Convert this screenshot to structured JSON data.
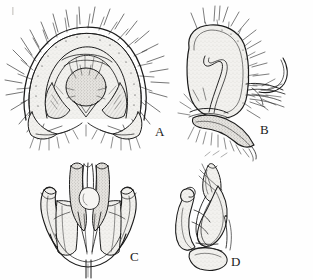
{
  "figure": {
    "type": "scientific-illustration-plate",
    "medium": "pen-and-ink line drawing",
    "background_color": "#fefefe",
    "ink_color": "#1a1a1a",
    "fill_tone": "#ebeae6",
    "panel_count": 4
  },
  "labels": {
    "a": "A",
    "b": "B",
    "c": "C",
    "d": "D"
  },
  "panels": [
    {
      "id": "A",
      "label": "A",
      "view": "ventral / posterior view",
      "description": "broad dome-shaped epandrium with dense radiating setae along the margin, paired inner arches, a central stippled ovoid lobe and paired basal surstyli",
      "label_position": {
        "x": 155,
        "y": 125
      },
      "bounds": {
        "x": 8,
        "y": 8,
        "w": 160,
        "h": 140
      }
    },
    {
      "id": "B",
      "label": "B",
      "view": "lateral view",
      "description": "rounded quadrate epandrial lobe stippled throughout, setae dense along posterior margin, curved apical hook and a ventral pointed projection bearing setae",
      "label_position": {
        "x": 260,
        "y": 123
      },
      "bounds": {
        "x": 175,
        "y": 5,
        "w": 135,
        "h": 150
      }
    },
    {
      "id": "C",
      "label": "C",
      "view": "ventral view of aedeagal complex",
      "description": "symmetric structure with paired outward-curving hook-like lateral gonostyli, a central column of parallel rods and a slender basal stem",
      "label_position": {
        "x": 130,
        "y": 250
      },
      "bounds": {
        "x": 28,
        "y": 158,
        "w": 120,
        "h": 118
      }
    },
    {
      "id": "D",
      "label": "D",
      "view": "lateral view of aedeagal complex",
      "description": "elongate curved overlapping lobes with an apical knob, a slender distal process and a rounded basal plate",
      "label_position": {
        "x": 231,
        "y": 255
      },
      "bounds": {
        "x": 170,
        "y": 158,
        "w": 105,
        "h": 118
      }
    }
  ]
}
